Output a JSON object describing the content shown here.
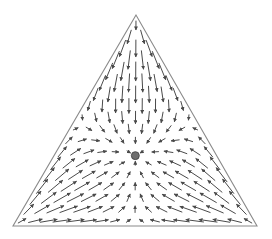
{
  "chart_data": {
    "type": "vector-field",
    "subtype": "simplex-phase-portrait",
    "title": "",
    "vertex_labels": [
      "",
      "",
      ""
    ],
    "dynamics": "replicator",
    "payoff_matrix": [
      [
        0,
        1,
        1
      ],
      [
        1,
        0,
        1
      ],
      [
        1,
        1,
        0
      ]
    ],
    "lattice_divisions": 17,
    "rest_points": [
      {
        "barycentric": [
          0.3333,
          0.3333,
          0.3333
        ],
        "stability": "stable",
        "marker": "filled-circle"
      }
    ],
    "flow_description": "All trajectories converge to the interior rest point at the barycenter; flow along each edge points toward the edge midpoint.",
    "colors": {
      "arrow": "#4a4a4a",
      "triangle": "#8a8a8a",
      "rest_point_fill": "#6e6e6e",
      "rest_point_stroke": "#3c3c3c",
      "background": "#ffffff"
    }
  }
}
